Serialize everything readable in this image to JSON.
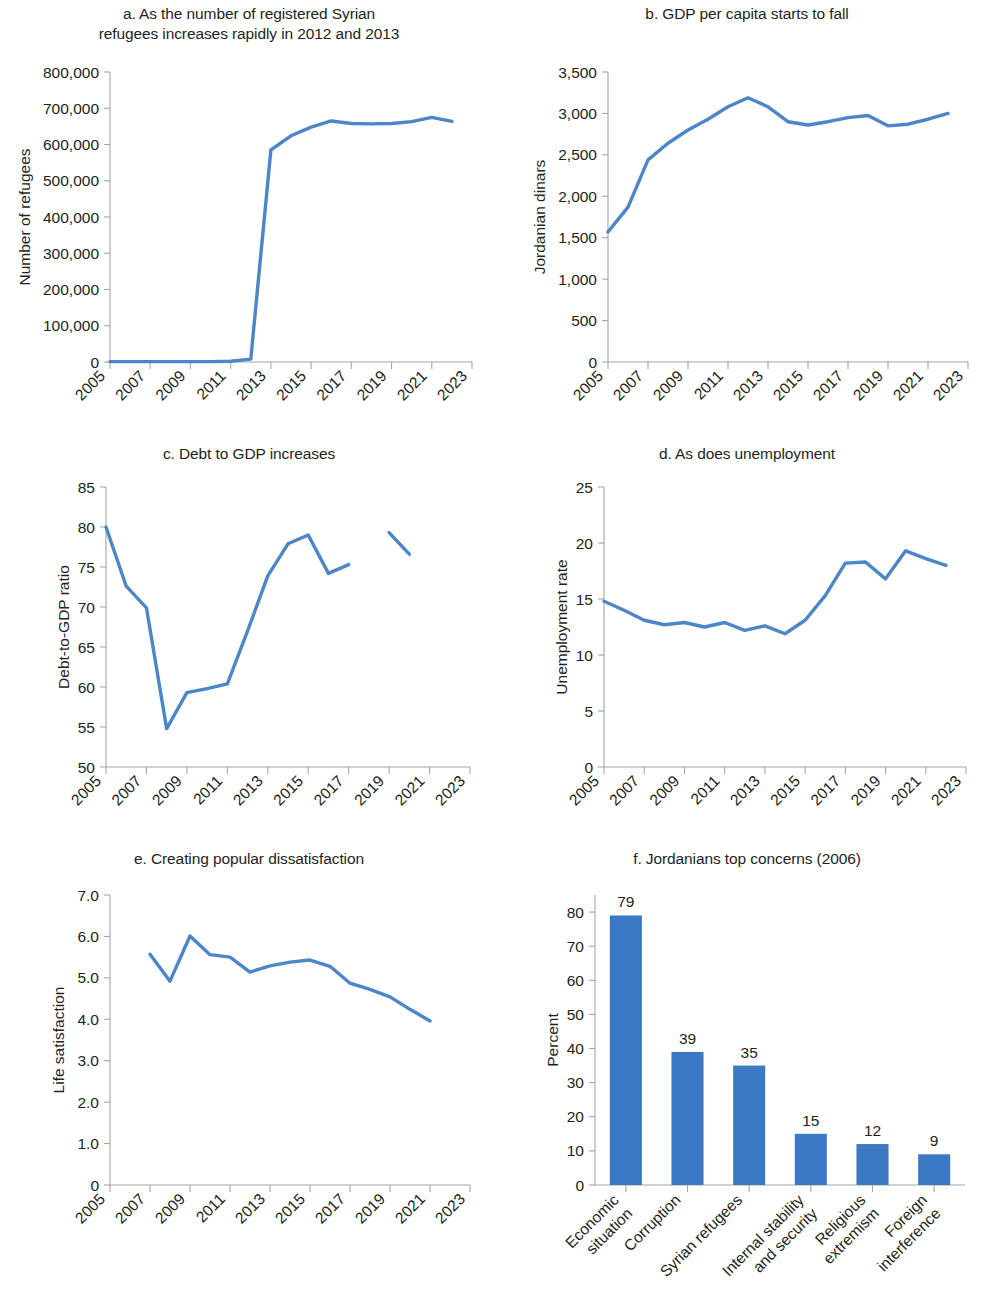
{
  "figure": {
    "accent_color": "#4a86c8",
    "bar_color": "#3b79c4",
    "axis_color": "#a6a6a6",
    "text_color": "#231f20"
  },
  "panels": [
    {
      "id": "a",
      "title": "a. As the number of registered Syrian\nrefugees increases rapidly in 2012 and 2013",
      "title_lines": [
        "a. As the number of registered Syrian",
        "refugees increases rapidly in 2012 and 2013"
      ],
      "ylabel": "Number of refugees",
      "xlabel": ""
    },
    {
      "id": "b",
      "title": "b. GDP per capita starts to fall",
      "title_lines": [
        "b. GDP per capita starts to fall"
      ],
      "ylabel": "Jordanian dinars",
      "xlabel": ""
    },
    {
      "id": "c",
      "title": "c. Debt to GDP increases",
      "title_lines": [
        "c. Debt to GDP increases"
      ],
      "ylabel": "Debt-to-GDP ratio",
      "xlabel": ""
    },
    {
      "id": "d",
      "title": "d. As does unemployment",
      "title_lines": [
        "d. As does unemployment"
      ],
      "ylabel": "Unemployment rate",
      "xlabel": ""
    },
    {
      "id": "e",
      "title": "e. Creating popular dissatisfaction",
      "title_lines": [
        "e. Creating popular dissatisfaction"
      ],
      "ylabel": "Life satisfaction",
      "xlabel": ""
    },
    {
      "id": "f",
      "title": "f. Jordanians top concerns (2006)",
      "title_lines": [
        "f. Jordanians top concerns (2006)"
      ],
      "ylabel": "Percent",
      "xlabel": ""
    }
  ],
  "chart_data": [
    {
      "panel": "a",
      "type": "line",
      "title": "a. As the number of registered Syrian refugees increases rapidly in 2012 and 2013",
      "xlabel": "",
      "ylabel": "Number of refugees",
      "xlim": [
        2005,
        2023
      ],
      "ylim": [
        0,
        800000
      ],
      "ytick_values": [
        0,
        100000,
        200000,
        300000,
        400000,
        500000,
        600000,
        700000,
        800000
      ],
      "ytick_labels": [
        "0",
        "100,000",
        "200,000",
        "300,000",
        "400,000",
        "500,000",
        "600,000",
        "700,000",
        "800,000"
      ],
      "xtick_values": [
        2005,
        2007,
        2009,
        2011,
        2013,
        2015,
        2017,
        2019,
        2021,
        2023
      ],
      "xtick_labels": [
        "2005",
        "2007",
        "2009",
        "2011",
        "2013",
        "2015",
        "2017",
        "2019",
        "2021",
        "2023"
      ],
      "grid": false,
      "legend": false,
      "series": [
        {
          "name": "Registered Syrian refugees",
          "x": [
            2005,
            2006,
            2007,
            2008,
            2009,
            2010,
            2011,
            2012,
            2013,
            2014,
            2015,
            2016,
            2017,
            2018,
            2019,
            2020,
            2021,
            2022
          ],
          "values": [
            1000,
            1000,
            1000,
            1000,
            1000,
            1000,
            2000,
            8000,
            585000,
            624000,
            648000,
            665000,
            658000,
            657000,
            658000,
            663000,
            675000,
            664000
          ]
        }
      ]
    },
    {
      "panel": "b",
      "type": "line",
      "title": "b. GDP per capita starts to fall",
      "xlabel": "",
      "ylabel": "Jordanian dinars",
      "xlim": [
        2005,
        2023
      ],
      "ylim": [
        0,
        3500
      ],
      "ytick_values": [
        0,
        500,
        1000,
        1500,
        2000,
        2500,
        3000,
        3500
      ],
      "ytick_labels": [
        "0",
        "500",
        "1,000",
        "1,500",
        "2,000",
        "2,500",
        "3,000",
        "3,500"
      ],
      "xtick_values": [
        2005,
        2007,
        2009,
        2011,
        2013,
        2015,
        2017,
        2019,
        2021,
        2023
      ],
      "xtick_labels": [
        "2005",
        "2007",
        "2009",
        "2011",
        "2013",
        "2015",
        "2017",
        "2019",
        "2021",
        "2023"
      ],
      "grid": false,
      "legend": false,
      "series": [
        {
          "name": "GDP per capita",
          "x": [
            2005,
            2006,
            2007,
            2008,
            2009,
            2010,
            2011,
            2012,
            2013,
            2014,
            2015,
            2016,
            2017,
            2018,
            2019,
            2020,
            2021,
            2022
          ],
          "values": [
            1570,
            1870,
            2440,
            2640,
            2800,
            2930,
            3080,
            3190,
            3080,
            2900,
            2860,
            2900,
            2950,
            2975,
            2850,
            2870,
            2930,
            3000
          ]
        }
      ]
    },
    {
      "panel": "c",
      "type": "line",
      "title": "c. Debt to GDP increases",
      "xlabel": "",
      "ylabel": "Debt-to-GDP ratio",
      "xlim": [
        2005,
        2023
      ],
      "ylim": [
        50,
        85
      ],
      "ytick_values": [
        50,
        55,
        60,
        65,
        70,
        75,
        80,
        85
      ],
      "ytick_labels": [
        "50",
        "55",
        "60",
        "65",
        "70",
        "75",
        "80",
        "85"
      ],
      "xtick_values": [
        2005,
        2007,
        2009,
        2011,
        2013,
        2015,
        2017,
        2019,
        2021,
        2023
      ],
      "xtick_labels": [
        "2005",
        "2007",
        "2009",
        "2011",
        "2013",
        "2015",
        "2017",
        "2019",
        "2021",
        "2023"
      ],
      "grid": false,
      "legend": false,
      "series": [
        {
          "name": "Debt-to-GDP ratio",
          "x": [
            2005,
            2006,
            2007,
            2008,
            2009,
            2010,
            2011,
            2012,
            2013,
            2014,
            2015,
            2016,
            2017
          ],
          "values": [
            80.0,
            72.6,
            69.9,
            54.8,
            59.3,
            59.8,
            60.4,
            67.0,
            73.9,
            77.9,
            79.0,
            74.2,
            75.3
          ]
        },
        {
          "name": "Debt-to-GDP ratio (revised series)",
          "x": [
            2019,
            2020
          ],
          "values": [
            79.3,
            76.6
          ]
        }
      ]
    },
    {
      "panel": "d",
      "type": "line",
      "title": "d. As does unemployment",
      "xlabel": "",
      "ylabel": "Unemployment rate",
      "xlim": [
        2005,
        2023
      ],
      "ylim": [
        0,
        25
      ],
      "ytick_values": [
        0,
        5,
        10,
        15,
        20,
        25
      ],
      "ytick_labels": [
        "0",
        "5",
        "10",
        "15",
        "20",
        "25"
      ],
      "xtick_values": [
        2005,
        2007,
        2009,
        2011,
        2013,
        2015,
        2017,
        2019,
        2021,
        2023
      ],
      "xtick_labels": [
        "2005",
        "2007",
        "2009",
        "2011",
        "2013",
        "2015",
        "2017",
        "2019",
        "2021",
        "2023"
      ],
      "grid": false,
      "legend": false,
      "series": [
        {
          "name": "Unemployment rate",
          "x": [
            2005,
            2006,
            2007,
            2008,
            2009,
            2010,
            2011,
            2012,
            2013,
            2014,
            2015,
            2016,
            2017,
            2018,
            2019,
            2020,
            2021,
            2022
          ],
          "values": [
            14.8,
            14.0,
            13.1,
            12.7,
            12.9,
            12.5,
            12.9,
            12.2,
            12.6,
            11.9,
            13.1,
            15.3,
            18.2,
            18.3,
            16.8,
            19.3,
            18.6,
            18.0
          ]
        }
      ]
    },
    {
      "panel": "e",
      "type": "line",
      "title": "e. Creating popular dissatisfaction",
      "xlabel": "",
      "ylabel": "Life satisfaction",
      "xlim": [
        2005,
        2023
      ],
      "ylim": [
        0,
        7
      ],
      "ytick_values": [
        0,
        1,
        2,
        3,
        4,
        5,
        6,
        7
      ],
      "ytick_labels": [
        "0",
        "1.0",
        "2.0",
        "3.0",
        "4.0",
        "5.0",
        "6.0",
        "7.0"
      ],
      "xtick_values": [
        2005,
        2007,
        2009,
        2011,
        2013,
        2015,
        2017,
        2019,
        2021,
        2023
      ],
      "xtick_labels": [
        "2005",
        "2007",
        "2009",
        "2011",
        "2013",
        "2015",
        "2017",
        "2019",
        "2021",
        "2023"
      ],
      "grid": false,
      "legend": false,
      "series": [
        {
          "name": "Life satisfaction",
          "x": [
            2007,
            2008,
            2009,
            2010,
            2011,
            2012,
            2013,
            2014,
            2015,
            2016,
            2017,
            2018,
            2019,
            2020,
            2021
          ],
          "values": [
            5.57,
            4.92,
            6.01,
            5.56,
            5.5,
            5.14,
            5.29,
            5.38,
            5.43,
            5.28,
            4.87,
            4.72,
            4.54,
            4.24,
            3.96
          ]
        }
      ]
    },
    {
      "panel": "f",
      "type": "bar",
      "title": "f. Jordanians top concerns (2006)",
      "xlabel": "",
      "ylabel": "Percent",
      "ylim": [
        0,
        85
      ],
      "ytick_values": [
        0,
        10,
        20,
        30,
        40,
        50,
        60,
        70,
        80
      ],
      "ytick_labels": [
        "0",
        "10",
        "20",
        "30",
        "40",
        "50",
        "60",
        "70",
        "80"
      ],
      "categories": [
        "Economic situation",
        "Corruption",
        "Syrian refugees",
        "Internal stability and security",
        "Religious extremism",
        "Foreign interference"
      ],
      "category_lines": [
        [
          "Economic",
          "situation"
        ],
        [
          "Corruption"
        ],
        [
          "Syrian refugees"
        ],
        [
          "Internal stability",
          "and security"
        ],
        [
          "Religious",
          "extremism"
        ],
        [
          "Foreign",
          "interference"
        ]
      ],
      "values": [
        79,
        39,
        35,
        15,
        12,
        9
      ],
      "value_labels": [
        "79",
        "39",
        "35",
        "15",
        "12",
        "9"
      ],
      "grid": false,
      "legend": false
    }
  ]
}
